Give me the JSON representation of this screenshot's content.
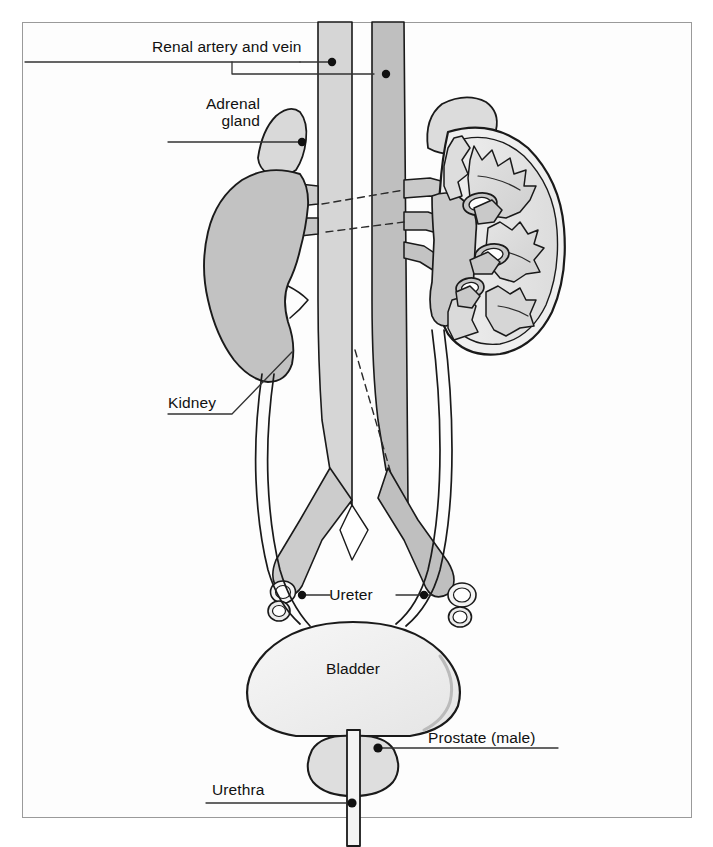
{
  "figure": {
    "type": "anatomical-diagram",
    "frame_color": "#9a9a9a",
    "background": "#ffffff"
  },
  "palette": {
    "outline": "#1a1a1a",
    "vessel_light": "#d2d2d2",
    "vessel_dark": "#bdbdbd",
    "kidney_solid": "#c0c0c0",
    "kidney_section": "#e8e8e8",
    "pyramid": "#d8d8d8",
    "adrenal": "#dcdcdc",
    "bladder": "#f2f2f2",
    "prostate": "#dedede",
    "leader": "#333333"
  },
  "labels": [
    {
      "id": "renal-artery-and-vein",
      "text": "Renal artery and vein",
      "lines": [
        "Renal artery and vein"
      ],
      "x": 152,
      "y": 38,
      "align": "left",
      "leader": "underline-with-two-branches",
      "dots": 2
    },
    {
      "id": "adrenal-gland",
      "text": "Adrenal gland",
      "lines": [
        "Adrenal",
        "gland"
      ],
      "x": 188,
      "y": 95,
      "align": "right",
      "leader": "horizontal-right",
      "dots": 1
    },
    {
      "id": "kidney",
      "text": "Kidney",
      "lines": [
        "Kidney"
      ],
      "x": 168,
      "y": 394,
      "align": "left",
      "leader": "underline-then-diagonal-up-right",
      "dots": 0
    },
    {
      "id": "ureter",
      "text": "Ureter",
      "lines": [
        "Ureter"
      ],
      "x": 336,
      "y": 588,
      "align": "center",
      "leader": "both-sides-horizontal",
      "dots": 2
    },
    {
      "id": "bladder",
      "text": "Bladder",
      "lines": [
        "Bladder"
      ],
      "x": 323,
      "y": 660,
      "align": "center",
      "leader": "none",
      "dots": 0
    },
    {
      "id": "prostate-male",
      "text": "Prostate (male)",
      "lines": [
        "Prostate (male)"
      ],
      "x": 428,
      "y": 731,
      "align": "left",
      "leader": "underline-to-left-dot",
      "dots": 1
    },
    {
      "id": "urethra",
      "text": "Urethra",
      "lines": [
        "Urethra"
      ],
      "x": 212,
      "y": 782,
      "align": "left",
      "leader": "underline-to-right-dot",
      "dots": 1
    }
  ],
  "structures": [
    {
      "name": "inferior-vena-cava",
      "side": "left",
      "shading": "light"
    },
    {
      "name": "abdominal-aorta",
      "side": "right",
      "shading": "dark"
    },
    {
      "name": "left-kidney",
      "view": "whole",
      "shading": "solid-gray"
    },
    {
      "name": "right-kidney",
      "view": "cross-section",
      "features": [
        "renal-pyramids",
        "calyces",
        "renal-pelvis",
        "cortex"
      ]
    },
    {
      "name": "left-adrenal-gland",
      "view": "whole"
    },
    {
      "name": "right-adrenal-gland",
      "view": "whole"
    },
    {
      "name": "left-ureter"
    },
    {
      "name": "right-ureter"
    },
    {
      "name": "common-iliac-vessels",
      "cut": "cross-section-ends"
    },
    {
      "name": "bladder"
    },
    {
      "name": "prostate"
    },
    {
      "name": "urethra"
    }
  ]
}
